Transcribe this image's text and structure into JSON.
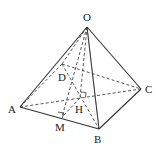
{
  "diagram": {
    "type": "pyramid",
    "points": {
      "O": {
        "label": "O",
        "x": 87,
        "y": 27
      },
      "A": {
        "label": "A",
        "x": 20,
        "y": 107
      },
      "B": {
        "label": "B",
        "x": 99,
        "y": 129
      },
      "C": {
        "label": "C",
        "x": 141,
        "y": 89
      },
      "D": {
        "label": "D",
        "x": 62,
        "y": 64
      },
      "H": {
        "label": "H",
        "x": 80,
        "y": 98
      },
      "M": {
        "label": "M",
        "x": 62,
        "y": 117
      }
    },
    "solid_edges": [
      "OA",
      "OB",
      "OC",
      "AB",
      "BC"
    ],
    "dashed_edges": [
      "OD",
      "AD",
      "DC",
      "AC",
      "BD",
      "OH",
      "OM",
      "HM"
    ],
    "right_angles": [
      "H (OH ⟂ base)",
      "M (OM ⟂ AB)"
    ]
  },
  "labels": {
    "O": "O",
    "A": "A",
    "B": "B",
    "C": "C",
    "D": "D",
    "H": "H",
    "M": "M"
  }
}
